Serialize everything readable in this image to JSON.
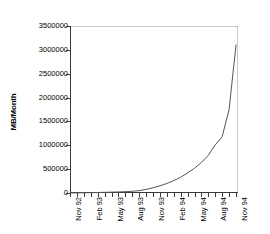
{
  "chart_data": {
    "type": "line",
    "title": "",
    "xlabel": "",
    "ylabel": "MB/Month",
    "ylim": [
      0,
      3500000
    ],
    "grid": false,
    "legend": "none",
    "y_ticks": [
      3500000,
      3000000,
      2500000,
      2000000,
      1500000,
      1000000,
      500000,
      0
    ],
    "y_tick_labels": [
      "3500000",
      "3000000",
      "2500000",
      "2000000",
      "1500000",
      "1000000",
      "500000",
      "0"
    ],
    "x_tick_labels": [
      "Nov 92",
      "Feb 93",
      "May 93",
      "Aug 93",
      "Nov 93",
      "Feb 94",
      "May 94",
      "Aug 94",
      "Nov 94"
    ],
    "x_tick_interval_months": 3,
    "minor_x_ticks_monthly": true,
    "x": [
      "Nov 92",
      "Dec 92",
      "Jan 93",
      "Feb 93",
      "Mar 93",
      "Apr 93",
      "May 93",
      "Jun 93",
      "Jul 93",
      "Aug 93",
      "Sep 93",
      "Oct 93",
      "Nov 93",
      "Dec 93",
      "Jan 94",
      "Feb 94",
      "Mar 94",
      "Apr 94",
      "May 94",
      "Jun 94",
      "Jul 94",
      "Aug 94",
      "Sep 94",
      "Oct 94",
      "Nov 94"
    ],
    "values": [
      2000,
      3000,
      5000,
      7000,
      10000,
      14000,
      18000,
      22000,
      28000,
      36000,
      50000,
      75000,
      110000,
      150000,
      200000,
      260000,
      330000,
      420000,
      520000,
      640000,
      790000,
      1010000,
      1180000,
      1750000,
      3100000
    ],
    "series": [
      {
        "name": "MB/Month",
        "color": "#555555",
        "values": [
          2000,
          3000,
          5000,
          7000,
          10000,
          14000,
          18000,
          22000,
          28000,
          36000,
          50000,
          75000,
          110000,
          150000,
          200000,
          260000,
          330000,
          420000,
          520000,
          640000,
          790000,
          1010000,
          1180000,
          1750000,
          3100000
        ]
      }
    ]
  }
}
